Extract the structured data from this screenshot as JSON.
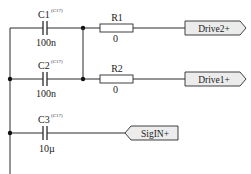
{
  "schematic": {
    "components": [
      {
        "ref": "C1",
        "superscript": "(C17)",
        "value": "100n",
        "type": "capacitor"
      },
      {
        "ref": "C2",
        "superscript": "(C17)",
        "value": "100n",
        "type": "capacitor"
      },
      {
        "ref": "C3",
        "superscript": "(C17)",
        "value": "10µ",
        "type": "capacitor"
      },
      {
        "ref": "R1",
        "value": "0",
        "type": "resistor"
      },
      {
        "ref": "R2",
        "value": "0",
        "type": "resistor"
      }
    ],
    "ports": [
      {
        "name": "Drive2+",
        "direction": "output"
      },
      {
        "name": "Drive1+",
        "direction": "output"
      },
      {
        "name": "SigIN+",
        "direction": "input"
      }
    ]
  }
}
